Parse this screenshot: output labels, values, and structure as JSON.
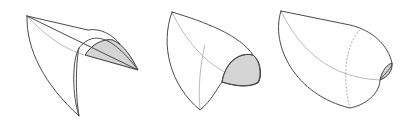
{
  "figure": {
    "shade_color": "#d4d4d4",
    "outer_stroke": "#4a4a4a",
    "inner_stroke": "#a8a8a8",
    "shapes": [
      {
        "id": "shape-1",
        "label": "stage 1: open folded sheet",
        "outer": "M27,16 C26,50 45,85 79,116 C72,95 72,60 79,48 C90,34 108,30 138,70 L27,16 Z",
        "rim": "M27,16 L88,30 C100,28 112,34 120,44",
        "inner_seam": "M27,16 C45,35 62,48 84,55",
        "inner_edge": "M79,48 C76,62 75,92 79,116",
        "shaded": "M85,55 C92,44 104,38 113,40 C125,46 132,58 138,70 L85,55 Z"
      },
      {
        "id": "shape-2",
        "label": "stage 2: partially closed",
        "outer": "M172,12 C160,45 170,85 200,110 C212,100 216,90 222,82 C226,60 240,52 253,55 C260,60 262,75 258,82 C250,88 235,86 222,82",
        "rim": "M172,12 C205,22 240,35 253,55",
        "inner_seam": "M172,12 C185,40 205,62 225,72",
        "inner_edge": "M205,45 C200,65 198,90 200,110",
        "shaded": "M222,82 C225,62 240,52 253,55 C262,62 262,78 258,83 C248,88 234,86 222,82 Z"
      },
      {
        "id": "shape-3",
        "label": "stage 3: nearly closed pod",
        "outer": "M281,11 C270,45 295,95 350,108 C370,104 380,90 380,80 C386,72 392,68 392,63 C388,45 372,30 350,25 L281,11 Z",
        "inner_seam": "M281,11 C300,50 330,78 380,80",
        "inner_edge": "M360,30 C345,45 342,80 350,108",
        "shaded": "M380,80 C382,70 388,64 392,63 C393,70 388,77 380,80 Z"
      }
    ]
  }
}
